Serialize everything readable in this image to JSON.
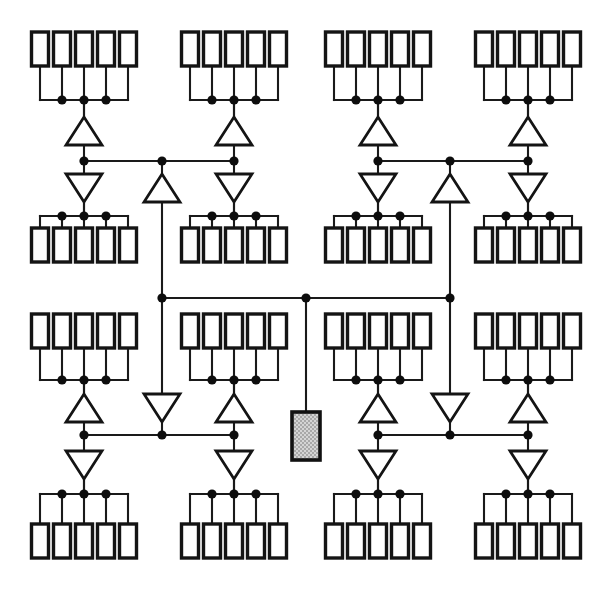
{
  "figure": {
    "kind": "schematic-diagram",
    "width": 613,
    "height": 592,
    "background_color": "#ffffff",
    "line_color": "#141414"
  },
  "legend": {
    "leaf_label": "register / load cell",
    "amplifier_label": "buffer amplifier",
    "junction_label": "wire junction",
    "source_label": "clock source"
  },
  "style": {
    "leaf": {
      "width": 17,
      "height": 34,
      "stroke": 3.4,
      "fill": "#ffffff"
    },
    "amp": {
      "width": 36,
      "height": 28,
      "stroke": 2.8,
      "fill": "#ffffff"
    },
    "junction": {
      "radius": 4.6,
      "fill": "#0d0d0d"
    },
    "wire": {
      "stroke": 2.1,
      "color": "#1a1a1a"
    },
    "source": {
      "fill": "#c9c9c9",
      "stroke": "#111111",
      "width": 28,
      "height": 48
    }
  },
  "chart_data": {
    "type": "diagram",
    "counts": {
      "leaf_clusters": 16,
      "cells_per_cluster": 5,
      "total_cells": 80,
      "up_amplifiers": 10,
      "down_amplifiers": 10,
      "source_blocks": 1
    }
  },
  "geometry": {
    "cluster_pitch_x": 145,
    "cell_pitch_x": 22,
    "cluster_bus_half_width": 44,
    "central_bus_y": 298,
    "central_bus_x1": 162,
    "central_bus_x2": 450,
    "central_bus_dots_x": [
      162,
      306,
      450
    ],
    "upper_bus_y": 161,
    "lower_bus_y": 435,
    "upper_bus_segments": [
      [
        84,
        234
      ],
      [
        378,
        528
      ]
    ],
    "lower_bus_segments": [
      [
        84,
        234
      ],
      [
        378,
        528
      ]
    ],
    "quadrant_stem_x": [
      84,
      234,
      378,
      528
    ],
    "center_stem_x": [
      162,
      450
    ],
    "source": {
      "x": 292,
      "y": 412,
      "width": 28,
      "height": 48,
      "stem_top": 298
    }
  },
  "clusters": [
    {
      "id": "c1",
      "name": "cluster-top-1",
      "cx": 84,
      "row": "top",
      "bus_y": 100,
      "cells_y": 32,
      "orient": "down"
    },
    {
      "id": "c2",
      "name": "cluster-top-2",
      "cx": 234,
      "row": "top",
      "bus_y": 100,
      "cells_y": 32,
      "orient": "down"
    },
    {
      "id": "c3",
      "name": "cluster-top-3",
      "cx": 378,
      "row": "top",
      "bus_y": 100,
      "cells_y": 32,
      "orient": "down"
    },
    {
      "id": "c4",
      "name": "cluster-top-4",
      "cx": 528,
      "row": "top",
      "bus_y": 100,
      "cells_y": 32,
      "orient": "down"
    },
    {
      "id": "c5",
      "name": "cluster-mid-up-1",
      "cx": 84,
      "row": "mid-upper",
      "bus_y": 216,
      "cells_y": 228,
      "orient": "up"
    },
    {
      "id": "c6",
      "name": "cluster-mid-up-2",
      "cx": 234,
      "row": "mid-upper",
      "bus_y": 216,
      "cells_y": 228,
      "orient": "up"
    },
    {
      "id": "c7",
      "name": "cluster-mid-up-3",
      "cx": 378,
      "row": "mid-upper",
      "bus_y": 216,
      "cells_y": 228,
      "orient": "up"
    },
    {
      "id": "c8",
      "name": "cluster-mid-up-4",
      "cx": 528,
      "row": "mid-upper",
      "bus_y": 216,
      "cells_y": 228,
      "orient": "up"
    },
    {
      "id": "c9",
      "name": "cluster-mid-low-1",
      "cx": 84,
      "row": "mid-lower",
      "bus_y": 380,
      "cells_y": 314,
      "orient": "down"
    },
    {
      "id": "c10",
      "name": "cluster-mid-low-2",
      "cx": 234,
      "row": "mid-lower",
      "bus_y": 380,
      "cells_y": 314,
      "orient": "down"
    },
    {
      "id": "c11",
      "name": "cluster-mid-low-3",
      "cx": 378,
      "row": "mid-lower",
      "bus_y": 380,
      "cells_y": 314,
      "orient": "down"
    },
    {
      "id": "c12",
      "name": "cluster-mid-low-4",
      "cx": 528,
      "row": "mid-lower",
      "bus_y": 380,
      "cells_y": 314,
      "orient": "down"
    },
    {
      "id": "c13",
      "name": "cluster-bottom-1",
      "cx": 84,
      "row": "bottom",
      "bus_y": 494,
      "cells_y": 524,
      "orient": "up"
    },
    {
      "id": "c14",
      "name": "cluster-bottom-2",
      "cx": 234,
      "row": "bottom",
      "bus_y": 494,
      "cells_y": 524,
      "orient": "up"
    },
    {
      "id": "c15",
      "name": "cluster-bottom-3",
      "cx": 378,
      "row": "bottom",
      "bus_y": 494,
      "cells_y": 524,
      "orient": "up"
    },
    {
      "id": "c16",
      "name": "cluster-bottom-4",
      "cx": 528,
      "row": "bottom",
      "bus_y": 494,
      "cells_y": 524,
      "orient": "up"
    }
  ],
  "amplifiers": [
    {
      "id": "a1",
      "name": "amp-top-left-up",
      "cx": 84,
      "cy": 131,
      "dir": "up"
    },
    {
      "id": "a2",
      "name": "amp-top-mid-up",
      "cx": 234,
      "cy": 131,
      "dir": "up"
    },
    {
      "id": "a3",
      "name": "amp-top-right-up",
      "cx": 378,
      "cy": 131,
      "dir": "up"
    },
    {
      "id": "a4",
      "name": "amp-top-far-up",
      "cx": 528,
      "cy": 131,
      "dir": "up"
    },
    {
      "id": "a5",
      "name": "amp-upper-left-down",
      "cx": 84,
      "cy": 188,
      "dir": "down"
    },
    {
      "id": "a6",
      "name": "amp-upper-mid-down",
      "cx": 234,
      "cy": 188,
      "dir": "down"
    },
    {
      "id": "a7",
      "name": "amp-upper-right-down",
      "cx": 378,
      "cy": 188,
      "dir": "down"
    },
    {
      "id": "a8",
      "name": "amp-upper-far-down",
      "cx": 528,
      "cy": 188,
      "dir": "down"
    },
    {
      "id": "a9",
      "name": "amp-center-left-up",
      "cx": 162,
      "cy": 188,
      "dir": "up"
    },
    {
      "id": "a10",
      "name": "amp-center-right-up",
      "cx": 450,
      "cy": 188,
      "dir": "up"
    },
    {
      "id": "a11",
      "name": "amp-center-left-down",
      "cx": 162,
      "cy": 408,
      "dir": "down"
    },
    {
      "id": "a12",
      "name": "amp-center-right-down",
      "cx": 450,
      "cy": 408,
      "dir": "down"
    },
    {
      "id": "a13",
      "name": "amp-lower-left-up",
      "cx": 84,
      "cy": 408,
      "dir": "up"
    },
    {
      "id": "a14",
      "name": "amp-lower-mid-up",
      "cx": 234,
      "cy": 408,
      "dir": "up"
    },
    {
      "id": "a15",
      "name": "amp-lower-right-up",
      "cx": 378,
      "cy": 408,
      "dir": "up"
    },
    {
      "id": "a16",
      "name": "amp-lower-far-up",
      "cx": 528,
      "cy": 408,
      "dir": "up"
    },
    {
      "id": "a17",
      "name": "amp-bottom-left-down",
      "cx": 84,
      "cy": 465,
      "dir": "down"
    },
    {
      "id": "a18",
      "name": "amp-bottom-mid-down",
      "cx": 234,
      "cy": 465,
      "dir": "down"
    },
    {
      "id": "a19",
      "name": "amp-bottom-right-down",
      "cx": 378,
      "cy": 465,
      "dir": "down"
    },
    {
      "id": "a20",
      "name": "amp-bottom-far-down",
      "cx": 528,
      "cy": 465,
      "dir": "down"
    }
  ]
}
